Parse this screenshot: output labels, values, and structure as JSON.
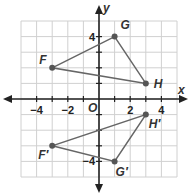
{
  "diagram": {
    "type": "coordinate-plane",
    "axes": {
      "x_label": "x",
      "y_label": "y",
      "origin_label": "O",
      "x_ticks": [
        {
          "value": -4,
          "label": "−4"
        },
        {
          "value": -2,
          "label": "−2"
        },
        {
          "value": 2,
          "label": "2"
        },
        {
          "value": 4,
          "label": "4"
        }
      ],
      "y_ticks": [
        {
          "value": 4,
          "label": "4"
        },
        {
          "value": -4,
          "label": "−4"
        }
      ],
      "range": {
        "xmin": -5,
        "xmax": 5,
        "ymin": -5,
        "ymax": 5
      }
    },
    "triangles": [
      {
        "name": "FGH",
        "vertices": [
          {
            "label": "F",
            "x": -3,
            "y": 2
          },
          {
            "label": "G",
            "x": 1,
            "y": 4
          },
          {
            "label": "H",
            "x": 3,
            "y": 1
          }
        ]
      },
      {
        "name": "F'G'H'",
        "vertices": [
          {
            "label": "F′",
            "x": -3,
            "y": -3
          },
          {
            "label": "G′",
            "x": 1,
            "y": -4
          },
          {
            "label": "H′",
            "x": 3,
            "y": -1
          }
        ]
      }
    ],
    "colors": {
      "grid": "#d0d0d0",
      "axis": "#222222",
      "triangle": "#666666",
      "point": "#555555"
    }
  }
}
